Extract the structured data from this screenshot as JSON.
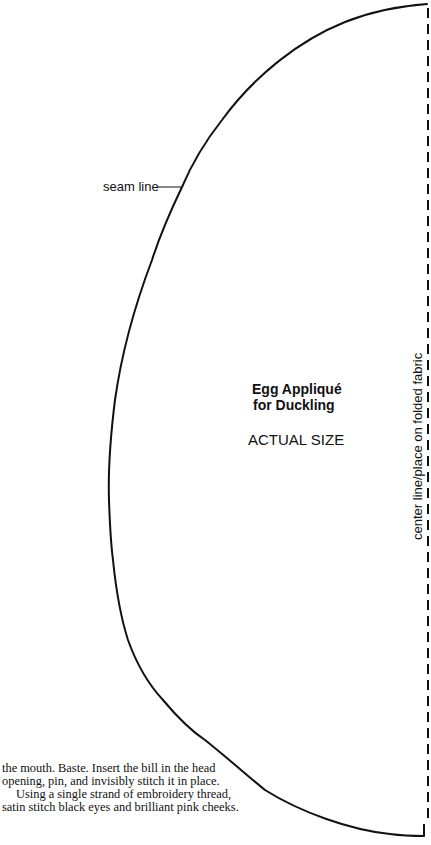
{
  "pattern": {
    "title_line1": "Egg Appliqué",
    "title_line2": "for Duckling",
    "scale_label": "ACTUAL SIZE",
    "seam_label": "seam line",
    "center_line_label": "center line/place on folded fabric",
    "colors": {
      "ink": "#111111",
      "paper": "#ffffff"
    }
  },
  "body_text": {
    "paragraph1": "the mouth. Baste. Insert the bill in the head opening, pin, and invisibly stitch it in place.",
    "paragraph2": "Using a single strand of embroidery thread, satin stitch black eyes and brilliant pink cheeks."
  }
}
